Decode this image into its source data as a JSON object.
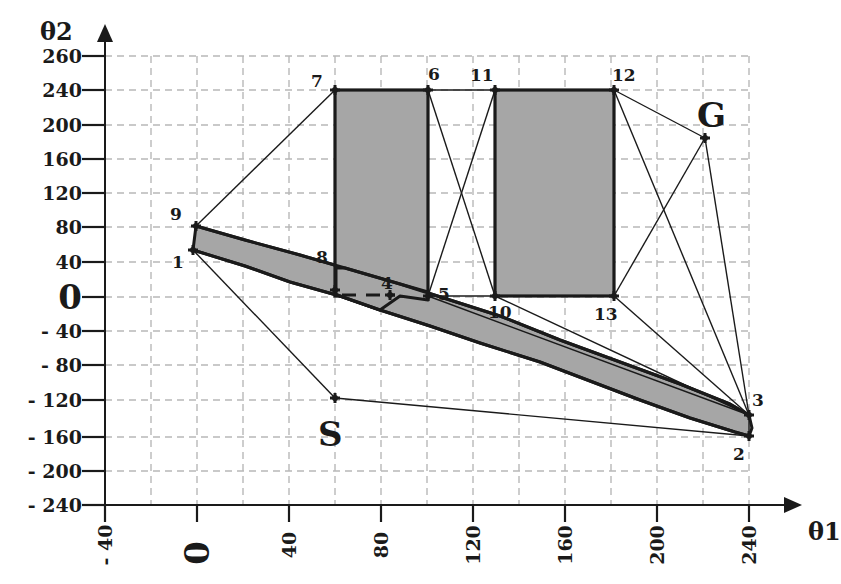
{
  "figure": {
    "type": "configuration-space visibility graph",
    "x_axis": {
      "name": "θ1",
      "ticks": [
        {
          "value": -40,
          "label": "- 40",
          "px": 105
        },
        {
          "value": 0,
          "label": "0",
          "px": 197
        },
        {
          "value": 40,
          "label": "40",
          "px": 289
        },
        {
          "value": 80,
          "label": "80",
          "px": 381
        },
        {
          "value": 120,
          "label": "120",
          "px": 473
        },
        {
          "value": 160,
          "label": "160",
          "px": 565
        },
        {
          "value": 200,
          "label": "200",
          "px": 657
        },
        {
          "value": 240,
          "label": "240",
          "px": 749
        }
      ]
    },
    "y_axis": {
      "name": "θ2",
      "ticks": [
        {
          "value": 260,
          "label": "260",
          "px": 56
        },
        {
          "value": 240,
          "label": "240",
          "px": 90
        },
        {
          "value": 200,
          "label": "200",
          "px": 125
        },
        {
          "value": 160,
          "label": "160",
          "px": 159
        },
        {
          "value": 120,
          "label": "120",
          "px": 193
        },
        {
          "value": 80,
          "label": "80",
          "px": 227
        },
        {
          "value": 40,
          "label": "40",
          "px": 262
        },
        {
          "value": 0,
          "label": "0",
          "px": 297
        },
        {
          "value": -40,
          "label": "- 40",
          "px": 331
        },
        {
          "value": -80,
          "label": "- 80",
          "px": 365
        },
        {
          "value": -120,
          "label": "- 120",
          "px": 400
        },
        {
          "value": -160,
          "label": "- 160",
          "px": 437
        },
        {
          "value": -200,
          "label": "- 200",
          "px": 471
        },
        {
          "value": -240,
          "label": "- 240",
          "px": 505
        }
      ]
    },
    "start_label": "S",
    "goal_label": "G",
    "vertices": [
      {
        "id": "1",
        "label": "1",
        "theta1": 0,
        "theta2": 50,
        "px": [
          193,
          250
        ],
        "label_px": [
          172,
          268
        ]
      },
      {
        "id": "2",
        "label": "2",
        "theta1": 240,
        "theta2": -160,
        "px": [
          749,
          436
        ],
        "label_px": [
          733,
          460
        ]
      },
      {
        "id": "3",
        "label": "3",
        "theta1": 240,
        "theta2": -135,
        "px": [
          749,
          415
        ],
        "label_px": [
          752,
          406
        ]
      },
      {
        "id": "4",
        "label": "4",
        "theta1": 80,
        "theta2": 0,
        "px": [
          390,
          295
        ],
        "label_px": [
          381,
          289
        ]
      },
      {
        "id": "5",
        "label": "5",
        "theta1": 100,
        "theta2": 0,
        "px": [
          428,
          296
        ],
        "label_px": [
          438,
          300
        ]
      },
      {
        "id": "6",
        "label": "6",
        "theta1": 100,
        "theta2": 240,
        "px": [
          428,
          90
        ],
        "label_px": [
          428,
          80
        ]
      },
      {
        "id": "7",
        "label": "7",
        "theta1": 60,
        "theta2": 240,
        "px": [
          335,
          90
        ],
        "label_px": [
          311,
          87
        ]
      },
      {
        "id": "8",
        "label": "8",
        "theta1": 60,
        "theta2": 10,
        "px": [
          335,
          290
        ],
        "label_px": [
          316,
          263
        ]
      },
      {
        "id": "9",
        "label": "9",
        "theta1": 0,
        "theta2": 80,
        "px": [
          196,
          226
        ],
        "label_px": [
          170,
          220
        ]
      },
      {
        "id": "10",
        "label": "10",
        "theta1": 130,
        "theta2": 0,
        "px": [
          495,
          296
        ],
        "label_px": [
          488,
          318
        ]
      },
      {
        "id": "11",
        "label": "11",
        "theta1": 130,
        "theta2": 240,
        "px": [
          495,
          90
        ],
        "label_px": [
          470,
          81
        ]
      },
      {
        "id": "12",
        "label": "12",
        "theta1": 180,
        "theta2": 240,
        "px": [
          614,
          90
        ],
        "label_px": [
          612,
          81
        ]
      },
      {
        "id": "13",
        "label": "13",
        "theta1": 180,
        "theta2": 0,
        "px": [
          614,
          296
        ],
        "label_px": [
          594,
          320
        ]
      },
      {
        "id": "S",
        "label": "S",
        "theta1": 60,
        "theta2": -120,
        "px": [
          335,
          398
        ],
        "label_px": [
          318,
          446
        ]
      },
      {
        "id": "G",
        "label": "G",
        "theta1": 220,
        "theta2": 180,
        "px": [
          705,
          138
        ],
        "label_px": [
          697,
          127
        ]
      }
    ],
    "obstacles": [
      {
        "name": "rect-obstacle-left",
        "corners": [
          "8",
          "7",
          "6",
          "5"
        ]
      },
      {
        "name": "rect-obstacle-right",
        "corners": [
          "10",
          "11",
          "12",
          "13"
        ]
      },
      {
        "name": "diagonal-band-obstacle",
        "corners": [
          "9",
          "1",
          "2",
          "3"
        ]
      }
    ],
    "edges": [
      [
        "S",
        "1"
      ],
      [
        "S",
        "2"
      ],
      [
        "1",
        "9"
      ],
      [
        "9",
        "7"
      ],
      [
        "7",
        "6"
      ],
      [
        "6",
        "11"
      ],
      [
        "11",
        "12"
      ],
      [
        "6",
        "10"
      ],
      [
        "11",
        "5"
      ],
      [
        "5",
        "10"
      ],
      [
        "10",
        "13"
      ],
      [
        "12",
        "G"
      ],
      [
        "13",
        "G"
      ],
      [
        "12",
        "3"
      ],
      [
        "G",
        "3"
      ],
      [
        "13",
        "3"
      ],
      [
        "10",
        "3"
      ],
      [
        "5",
        "3"
      ],
      [
        "3",
        "2"
      ]
    ],
    "hidden_edge": [
      "8",
      "4"
    ]
  }
}
